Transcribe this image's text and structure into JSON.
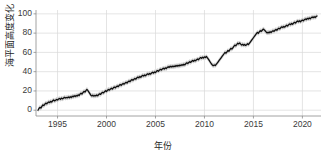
{
  "chart_data": {
    "type": "line",
    "title": "",
    "xlabel": "年份",
    "ylabel": "海平面高度变化（mm）",
    "ylabel_text": "海平面高度变化（mm）",
    "units": "mm",
    "xlim": [
      1992.8,
      2021.9
    ],
    "ylim": [
      -6,
      104
    ],
    "xticks": [
      1995,
      2000,
      2005,
      2010,
      2015,
      2020
    ],
    "xtick_labels": [
      "1995",
      "2000",
      "2005",
      "2010",
      "2015",
      "2020"
    ],
    "yticks": [
      0,
      20,
      40,
      60,
      80,
      100
    ],
    "ytick_labels": [
      "0",
      "20",
      "40",
      "60",
      "80",
      "100"
    ],
    "grid": true,
    "grid_axis": "both",
    "legend": "none",
    "line_color": "#0d0d0d",
    "band_color": "#c8c8c8",
    "band_label": "uncertainty",
    "band_halfwidth": 2.4,
    "series": [
      {
        "name": "海平面高度变化",
        "x": [
          1993.0,
          1993.1,
          1993.2,
          1993.3,
          1993.4,
          1993.5,
          1993.6,
          1993.7,
          1993.8,
          1993.9,
          1994.0,
          1994.1,
          1994.2,
          1994.3,
          1994.4,
          1994.5,
          1994.6,
          1994.7,
          1994.8,
          1994.9,
          1995.0,
          1995.1,
          1995.2,
          1995.3,
          1995.4,
          1995.5,
          1995.6,
          1995.7,
          1995.8,
          1995.9,
          1996.0,
          1996.1,
          1996.2,
          1996.3,
          1996.4,
          1996.5,
          1996.6,
          1996.7,
          1996.8,
          1996.9,
          1997.0,
          1997.1,
          1997.2,
          1997.3,
          1997.4,
          1997.5,
          1997.6,
          1997.7,
          1997.8,
          1997.9,
          1998.0,
          1998.1,
          1998.2,
          1998.3,
          1998.4,
          1998.5,
          1998.6,
          1998.7,
          1998.8,
          1998.9,
          1999.0,
          1999.1,
          1999.2,
          1999.3,
          1999.4,
          1999.5,
          1999.6,
          1999.7,
          1999.8,
          1999.9,
          2000.0,
          2000.1,
          2000.2,
          2000.3,
          2000.4,
          2000.5,
          2000.6,
          2000.7,
          2000.8,
          2000.9,
          2001.0,
          2001.1,
          2001.2,
          2001.3,
          2001.4,
          2001.5,
          2001.6,
          2001.7,
          2001.8,
          2001.9,
          2002.0,
          2002.1,
          2002.2,
          2002.3,
          2002.4,
          2002.5,
          2002.6,
          2002.7,
          2002.8,
          2002.9,
          2003.0,
          2003.1,
          2003.2,
          2003.3,
          2003.4,
          2003.5,
          2003.6,
          2003.7,
          2003.8,
          2003.9,
          2004.0,
          2004.1,
          2004.2,
          2004.3,
          2004.4,
          2004.5,
          2004.6,
          2004.7,
          2004.8,
          2004.9,
          2005.0,
          2005.1,
          2005.2,
          2005.3,
          2005.4,
          2005.5,
          2005.6,
          2005.7,
          2005.8,
          2005.9,
          2006.0,
          2006.1,
          2006.2,
          2006.3,
          2006.4,
          2006.5,
          2006.6,
          2006.7,
          2006.8,
          2006.9,
          2007.0,
          2007.1,
          2007.2,
          2007.3,
          2007.4,
          2007.5,
          2007.6,
          2007.7,
          2007.8,
          2007.9,
          2008.0,
          2008.1,
          2008.2,
          2008.3,
          2008.4,
          2008.5,
          2008.6,
          2008.7,
          2008.8,
          2008.9,
          2009.0,
          2009.1,
          2009.2,
          2009.3,
          2009.4,
          2009.5,
          2009.6,
          2009.7,
          2009.8,
          2009.9,
          2010.0,
          2010.1,
          2010.2,
          2010.3,
          2010.4,
          2010.5,
          2010.6,
          2010.7,
          2010.8,
          2010.9,
          2011.0,
          2011.1,
          2011.2,
          2011.3,
          2011.4,
          2011.5,
          2011.6,
          2011.7,
          2011.8,
          2011.9,
          2012.0,
          2012.1,
          2012.2,
          2012.3,
          2012.4,
          2012.5,
          2012.6,
          2012.7,
          2012.8,
          2012.9,
          2013.0,
          2013.1,
          2013.2,
          2013.3,
          2013.4,
          2013.5,
          2013.6,
          2013.7,
          2013.8,
          2013.9,
          2014.0,
          2014.1,
          2014.2,
          2014.3,
          2014.4,
          2014.5,
          2014.6,
          2014.7,
          2014.8,
          2014.9,
          2015.0,
          2015.1,
          2015.2,
          2015.3,
          2015.4,
          2015.5,
          2015.6,
          2015.7,
          2015.8,
          2015.9,
          2016.0,
          2016.1,
          2016.2,
          2016.3,
          2016.4,
          2016.5,
          2016.6,
          2016.7,
          2016.8,
          2016.9,
          2017.0,
          2017.1,
          2017.2,
          2017.3,
          2017.4,
          2017.5,
          2017.6,
          2017.7,
          2017.8,
          2017.9,
          2018.0,
          2018.1,
          2018.2,
          2018.3,
          2018.4,
          2018.5,
          2018.6,
          2018.7,
          2018.8,
          2018.9,
          2019.0,
          2019.1,
          2019.2,
          2019.3,
          2019.4,
          2019.5,
          2019.6,
          2019.7,
          2019.8,
          2019.9,
          2020.0,
          2020.1,
          2020.2,
          2020.3,
          2020.4,
          2020.5,
          2020.6,
          2020.7,
          2020.8,
          2020.9,
          2021.0,
          2021.1,
          2021.2,
          2021.3,
          2021.4,
          2021.5
        ],
        "y": [
          0.0,
          1.8,
          3.0,
          2.2,
          4.0,
          5.5,
          4.8,
          6.2,
          7.4,
          6.6,
          7.8,
          8.6,
          7.9,
          9.2,
          8.4,
          9.8,
          10.6,
          9.6,
          10.4,
          11.2,
          10.5,
          11.6,
          12.2,
          11.4,
          12.6,
          11.8,
          12.4,
          13.4,
          12.6,
          13.2,
          12.8,
          13.8,
          12.9,
          14.0,
          13.2,
          14.6,
          13.8,
          15.0,
          14.2,
          15.4,
          14.6,
          16.0,
          15.2,
          16.8,
          17.6,
          16.8,
          18.4,
          19.6,
          18.8,
          20.4,
          21.6,
          20.4,
          18.8,
          17.2,
          15.6,
          14.8,
          15.6,
          14.6,
          15.4,
          14.8,
          15.8,
          15.0,
          16.2,
          17.0,
          16.4,
          17.8,
          18.6,
          17.9,
          19.2,
          20.2,
          19.4,
          20.8,
          21.6,
          20.8,
          22.0,
          22.8,
          22.0,
          23.2,
          24.0,
          23.2,
          24.4,
          25.2,
          24.4,
          25.8,
          26.6,
          25.8,
          27.0,
          27.8,
          27.0,
          28.2,
          29.0,
          28.2,
          29.6,
          30.4,
          29.6,
          31.0,
          31.8,
          31.0,
          32.2,
          33.0,
          32.2,
          33.6,
          34.4,
          33.6,
          35.0,
          34.2,
          35.4,
          36.2,
          35.4,
          36.6,
          35.8,
          37.0,
          37.8,
          37.0,
          38.2,
          37.4,
          38.6,
          39.4,
          38.6,
          39.8,
          39.0,
          40.4,
          41.2,
          40.4,
          41.6,
          42.4,
          41.6,
          42.8,
          43.6,
          42.8,
          44.0,
          43.2,
          44.4,
          45.2,
          44.4,
          45.6,
          44.8,
          45.8,
          44.9,
          46.0,
          45.2,
          46.4,
          45.6,
          46.6,
          45.8,
          47.0,
          46.2,
          47.4,
          46.6,
          47.8,
          47.0,
          48.4,
          49.2,
          48.4,
          49.6,
          50.4,
          49.6,
          50.8,
          51.6,
          50.8,
          52.0,
          51.2,
          52.4,
          53.2,
          52.4,
          53.8,
          54.6,
          53.8,
          55.0,
          54.2,
          55.4,
          54.6,
          55.8,
          54.4,
          53.0,
          51.4,
          49.8,
          48.2,
          47.0,
          46.2,
          47.0,
          46.4,
          47.6,
          48.8,
          50.2,
          51.6,
          53.0,
          54.4,
          55.8,
          57.2,
          58.6,
          60.0,
          59.2,
          60.6,
          62.0,
          61.2,
          62.8,
          64.2,
          63.4,
          64.8,
          66.2,
          67.6,
          66.8,
          68.2,
          69.6,
          68.8,
          69.8,
          68.6,
          67.6,
          68.4,
          67.4,
          68.2,
          67.2,
          68.0,
          69.0,
          68.2,
          69.6,
          71.0,
          72.4,
          73.8,
          75.2,
          76.6,
          78.0,
          79.4,
          80.8,
          79.8,
          81.2,
          82.6,
          81.8,
          83.0,
          84.2,
          83.4,
          82.4,
          81.2,
          80.2,
          81.0,
          80.2,
          81.4,
          80.6,
          81.8,
          82.6,
          81.8,
          83.0,
          83.8,
          83.0,
          84.4,
          85.2,
          84.4,
          85.8,
          86.6,
          85.8,
          87.0,
          86.2,
          87.4,
          88.2,
          87.4,
          88.8,
          89.6,
          88.8,
          90.0,
          89.2,
          90.4,
          91.2,
          90.4,
          91.8,
          92.6,
          91.8,
          92.8,
          91.8,
          92.8,
          93.6,
          92.8,
          94.0,
          94.8,
          94.0,
          95.4,
          94.6,
          95.8,
          94.8,
          96.0,
          96.8,
          96.0,
          97.0,
          96.2,
          97.2,
          97.8
        ]
      }
    ],
    "notes": {
      "start_value": 0,
      "end_value": 97.8,
      "total_rise_mm": 97.8,
      "features": [
        "1997-1998 El Nino peak ~21 mm then sharp drop to ~15 mm",
        "2010-2011 La Nina dip from ~56 mm to ~46 mm",
        "2015-2016 El Nino bump to ~84 mm then dip to ~80 mm"
      ]
    }
  }
}
